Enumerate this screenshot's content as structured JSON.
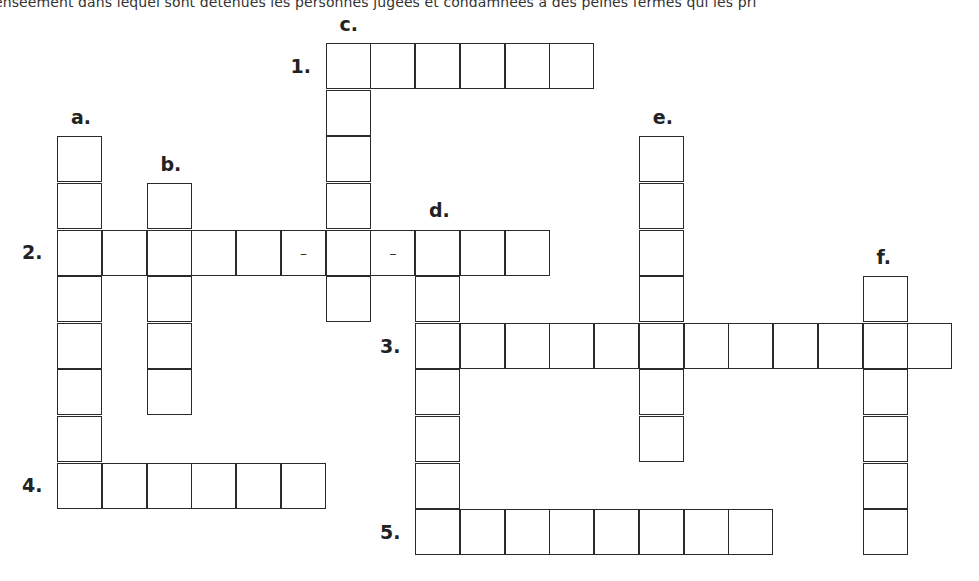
{
  "header": {
    "text": "enseement dans lequel sont détenues les personnes jugées et condamnées à des peines fermes qui les pri"
  },
  "grid": {
    "origin_x": 58,
    "origin_y": 44,
    "step_x": 44.75,
    "step_y": 46.6,
    "dash_glyph": "–"
  },
  "across": [
    {
      "label": "1.",
      "row": 0,
      "col": 6,
      "length": 6,
      "dashes": []
    },
    {
      "label": "2.",
      "row": 4,
      "col": 0,
      "length": 11,
      "dashes": [
        5,
        7
      ]
    },
    {
      "label": "3.",
      "row": 6,
      "col": 8,
      "length": 12,
      "dashes": []
    },
    {
      "label": "4.",
      "row": 9,
      "col": 0,
      "length": 6,
      "dashes": []
    },
    {
      "label": "5.",
      "row": 10,
      "col": 8,
      "length": 8,
      "dashes": []
    }
  ],
  "down": [
    {
      "label": "a.",
      "row": 2,
      "col": 0,
      "length": 8
    },
    {
      "label": "b.",
      "row": 3,
      "col": 2,
      "length": 5
    },
    {
      "label": "c.",
      "row": 0,
      "col": 6,
      "length": 6
    },
    {
      "label": "d.",
      "row": 4,
      "col": 8,
      "length": 7
    },
    {
      "label": "e.",
      "row": 2,
      "col": 13,
      "length": 7
    },
    {
      "label": "f.",
      "row": 5,
      "col": 18,
      "length": 6
    }
  ]
}
